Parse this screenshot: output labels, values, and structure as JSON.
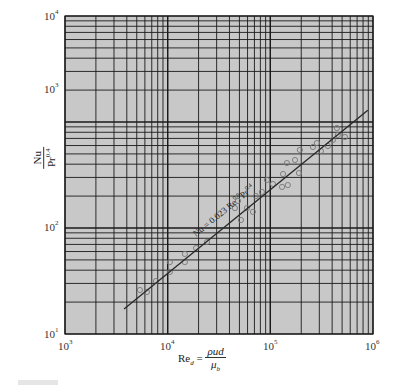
{
  "chart_data": {
    "type": "scatter",
    "title": "",
    "xscale": "log",
    "yscale": "log",
    "xlim": [
      1000,
      1000000
    ],
    "ylim": [
      10,
      10000
    ],
    "grid": true,
    "x_tick_labels": [
      "10^3",
      "10^4",
      "10^5",
      "10^6"
    ],
    "y_tick_labels": [
      "10^1",
      "10^2",
      "10^3",
      "10^4"
    ],
    "xlabel": "Re_d = ρud / μ_b",
    "ylabel": "Nu / Pr^0.4",
    "annotation": "Nu = 0.023 Re^0.8 Pr^0.4",
    "series": [
      {
        "name": "Experimental data",
        "marker": "open-circle",
        "points": [
          [
            5370,
            26.0
          ],
          [
            6280,
            24.9
          ],
          [
            7690,
            31.6
          ],
          [
            10500,
            47.7
          ],
          [
            10500,
            38.5
          ],
          [
            14700,
            56.9
          ],
          [
            14700,
            47.7
          ],
          [
            18900,
            64.7
          ],
          [
            24200,
            73.8
          ],
          [
            45200,
            154
          ],
          [
            48400,
            180
          ],
          [
            51800,
            119
          ],
          [
            59200,
            154
          ],
          [
            67700,
            142
          ],
          [
            72400,
            200
          ],
          [
            82800,
            219
          ],
          [
            92700,
            284
          ],
          [
            106000,
            260
          ],
          [
            133000,
            323
          ],
          [
            130000,
            244
          ],
          [
            148000,
            254
          ],
          [
            145000,
            410
          ],
          [
            174000,
            438
          ],
          [
            194000,
            545
          ],
          [
            190000,
            330
          ],
          [
            260000,
            581
          ],
          [
            284000,
            634
          ],
          [
            311000,
            533
          ],
          [
            364000,
            594
          ],
          [
            407000,
            677
          ],
          [
            455000,
            754
          ],
          [
            533000,
            722
          ],
          [
            445000,
            877
          ]
        ]
      },
      {
        "name": "Nu = 0.023 Re^0.8 Pr^0.4",
        "type": "line",
        "points": [
          [
            3760,
            17.2
          ],
          [
            890000,
            1290
          ]
        ]
      }
    ]
  },
  "labels": {
    "x_ticks": [
      {
        "base": "10",
        "exp": "3"
      },
      {
        "base": "10",
        "exp": "4"
      },
      {
        "base": "10",
        "exp": "5"
      },
      {
        "base": "10",
        "exp": "6"
      }
    ],
    "y_ticks": [
      {
        "base": "10",
        "exp": "1"
      },
      {
        "base": "10",
        "exp": "2"
      },
      {
        "base": "10",
        "exp": "3"
      },
      {
        "base": "10",
        "exp": "4"
      }
    ],
    "ylabel_num": "Nu",
    "ylabel_den_base": "Pr",
    "ylabel_den_exp": "0.4",
    "xlabel_lhs": "Re",
    "xlabel_sub": "d",
    "xlabel_eq": " = ",
    "xlabel_num": "ρud",
    "xlabel_den": "μ",
    "xlabel_den_sub": "b",
    "annotation_text": "Nu = 0.023 Re",
    "annotation_exp1": "0.8",
    "annotation_mid": "Pr",
    "annotation_exp2": "0.4"
  },
  "colors": {
    "plot_bg": "#c8c8c8",
    "grid": "#1a1a1a",
    "marker": "#777777",
    "line": "#2a2a2a"
  }
}
